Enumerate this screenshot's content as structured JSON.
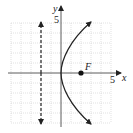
{
  "diagram": {
    "type": "parabola-graph",
    "equation": "y^2 = 8x",
    "axes": {
      "x_label": "x",
      "y_label": "y",
      "x_tick_label": "5",
      "y_tick_label": "5",
      "range": [
        -5,
        5
      ]
    },
    "focus": {
      "label": "F",
      "x": 2,
      "y": 0
    },
    "directrix": {
      "x": -2,
      "style": "dashed"
    },
    "vertex": {
      "x": 0,
      "y": 0
    },
    "colors": {
      "curve": "#222222",
      "grid": "#cccccc",
      "axes": "#333333"
    }
  }
}
